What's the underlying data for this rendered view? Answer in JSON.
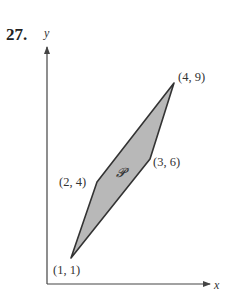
{
  "problem_number": "27.",
  "axes": {
    "x_label": "x",
    "y_label": "y"
  },
  "region_label": "𝓟",
  "colors": {
    "fill": "#b8b8b8",
    "stroke": "#333333",
    "axis": "#444444"
  },
  "vertices": [
    {
      "label": "(1, 1)",
      "x": 1,
      "y": 1
    },
    {
      "label": "(2, 4)",
      "x": 2,
      "y": 4
    },
    {
      "label": "(4, 9)",
      "x": 4,
      "y": 9
    },
    {
      "label": "(3, 6)",
      "x": 3,
      "y": 6
    }
  ]
}
